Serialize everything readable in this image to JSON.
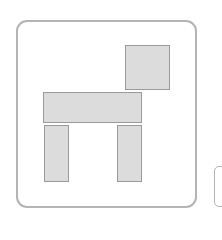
{
  "icon_tile": {
    "name": "dog-shape-icon",
    "border_color": "#b4b4b4",
    "block_fill": "#dcdcdc",
    "block_border": "#9a9a9a",
    "shapes": [
      {
        "part": "head",
        "x": 125,
        "y": 45,
        "w": 45,
        "h": 45
      },
      {
        "part": "body",
        "x": 43,
        "y": 92,
        "w": 99,
        "h": 31
      },
      {
        "part": "left-leg",
        "x": 44,
        "y": 125,
        "w": 25,
        "h": 57
      },
      {
        "part": "right-leg",
        "x": 117,
        "y": 125,
        "w": 25,
        "h": 57
      }
    ]
  },
  "adjacent_tile": {
    "name": "next-tile-partial"
  }
}
